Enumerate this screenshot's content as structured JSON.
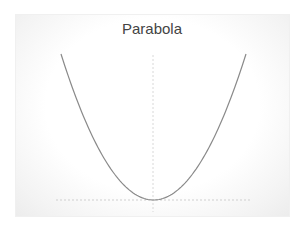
{
  "chart_data": {
    "type": "line",
    "title": "Parabola",
    "xlabel": "",
    "ylabel": "",
    "function": "y = x^2",
    "x": [
      -5,
      -4,
      -3,
      -2,
      -1,
      0,
      1,
      2,
      3,
      4,
      5
    ],
    "series": [
      {
        "name": "y = x^2",
        "values": [
          25,
          16,
          9,
          4,
          1,
          0,
          1,
          4,
          9,
          16,
          25
        ]
      }
    ],
    "xlim": [
      -5,
      5
    ],
    "ylim": [
      0,
      25
    ],
    "axes": {
      "style": "dashed",
      "x_axis_at_y": 0,
      "y_axis_at_x": 0
    },
    "grid": false,
    "legend": false,
    "colors": {
      "line": "#8a8a8a",
      "axis": "#d6d6d6",
      "title": "#444444"
    }
  }
}
